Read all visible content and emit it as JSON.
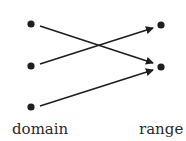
{
  "diagram": {
    "type": "function-mapping",
    "colors": {
      "ink": "#1e1e1e",
      "background": "#ffffff"
    },
    "domain": {
      "label": "domain",
      "points": [
        {
          "id": "d1",
          "x": 31,
          "y": 24
        },
        {
          "id": "d2",
          "x": 31,
          "y": 66
        },
        {
          "id": "d3",
          "x": 31,
          "y": 107
        }
      ]
    },
    "range": {
      "label": "range",
      "points": [
        {
          "id": "r1",
          "x": 161,
          "y": 25
        },
        {
          "id": "r2",
          "x": 161,
          "y": 67
        }
      ]
    },
    "arrows": [
      {
        "from": "d1",
        "to": "r2"
      },
      {
        "from": "d2",
        "to": "r1"
      },
      {
        "from": "d3",
        "to": "r2"
      }
    ]
  }
}
